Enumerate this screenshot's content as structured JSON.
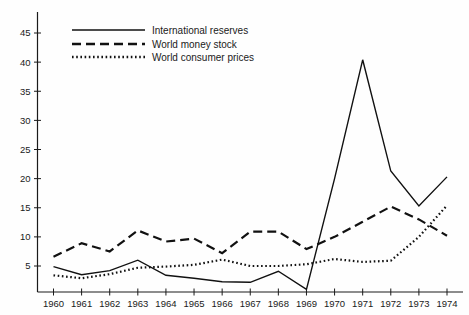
{
  "chart_data": {
    "type": "line",
    "title": "",
    "subtitle": "",
    "xlabel": "",
    "ylabel": "",
    "x": [
      1960,
      1961,
      1962,
      1963,
      1964,
      1965,
      1966,
      1967,
      1968,
      1969,
      1970,
      1971,
      1972,
      1973,
      1974
    ],
    "categories": [
      "1960",
      "1961",
      "1962",
      "1963",
      "1964",
      "1965",
      "1966",
      "1967",
      "1968",
      "1969",
      "1970",
      "1971",
      "1972",
      "1973",
      "1974"
    ],
    "xlim": [
      1959.4,
      1974.6
    ],
    "ylim": [
      0,
      48
    ],
    "yticks": [
      5,
      10,
      15,
      20,
      25,
      30,
      35,
      40,
      45
    ],
    "ytick_labels": [
      "5",
      "10",
      "15",
      "20",
      "25",
      "30",
      "35",
      "40",
      "45"
    ],
    "grid": false,
    "legend_position": "top-center",
    "series": [
      {
        "name": "International reserves",
        "style": "solid",
        "values": [
          4.9,
          3.5,
          4.2,
          6.0,
          3.4,
          2.9,
          2.3,
          2.2,
          4.1,
          1.0,
          20.0,
          40.4,
          21.3,
          15.3,
          20.3
        ]
      },
      {
        "name": "World money stock",
        "style": "dashed",
        "values": [
          6.6,
          8.9,
          7.5,
          11.1,
          9.2,
          9.7,
          7.2,
          10.9,
          10.9,
          7.9,
          10.0,
          12.6,
          15.2,
          13.0,
          10.2
        ]
      },
      {
        "name": "World consumer prices",
        "style": "dotted",
        "values": [
          3.4,
          2.9,
          3.6,
          4.7,
          4.9,
          5.2,
          6.1,
          5.0,
          5.0,
          5.3,
          6.2,
          5.7,
          5.9,
          10.0,
          15.4
        ]
      }
    ]
  },
  "legend": {
    "items": [
      {
        "label": "International reserves",
        "style": "solid"
      },
      {
        "label": "World money stock",
        "style": "dashed"
      },
      {
        "label": "World consumer prices",
        "style": "dotted"
      }
    ]
  }
}
